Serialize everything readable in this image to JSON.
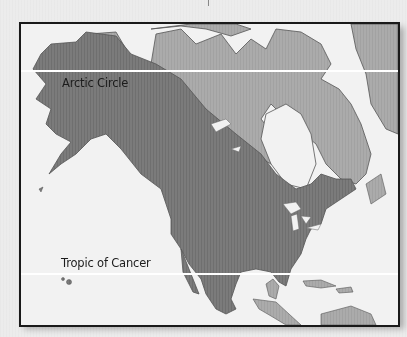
{
  "map": {
    "title": "",
    "colors": {
      "water": "#f2f2f2",
      "range_dark": "#7b7b7b",
      "land_light": "#aaaaaa",
      "outline": "#555555",
      "frame": "#1a1a1a",
      "lat_line": "#ffffff"
    },
    "latitude_lines": [
      {
        "label": "Arctic Circle"
      },
      {
        "label": "Tropic of Cancer"
      }
    ]
  }
}
